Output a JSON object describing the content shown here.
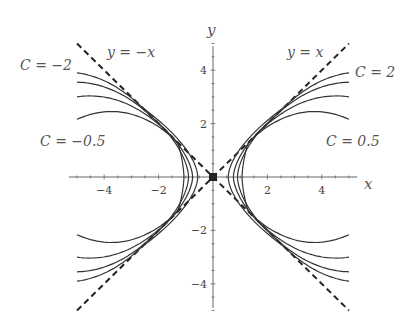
{
  "chart_data": {
    "type": "line",
    "title": "",
    "xlabel": "x",
    "ylabel": "y",
    "xlim": [
      -5.3,
      5.3
    ],
    "ylim": [
      -5.0,
      5.0
    ],
    "grid": false,
    "x_ticks": [
      -4,
      -2,
      2,
      4
    ],
    "y_ticks": [
      -4,
      -2,
      2,
      4
    ],
    "x_tick_labels": [
      "−4",
      "−2",
      "2",
      "4"
    ],
    "y_tick_labels": [
      "−4",
      "−2",
      "2",
      "4"
    ],
    "asymptotes": [
      {
        "name": "y = x",
        "label": "y = x",
        "style": "dashed",
        "from": [
          -5,
          -5
        ],
        "to": [
          5,
          5
        ]
      },
      {
        "name": "y = −x",
        "label": "y = −x",
        "style": "dashed",
        "from": [
          -5,
          5
        ],
        "to": [
          5,
          -5
        ]
      }
    ],
    "series": [
      {
        "name": "C = 0.5",
        "vertex_x": 1.07,
        "tangent_point": 1.3,
        "y_at_x5": 2.16
      },
      {
        "name": "C = 1",
        "vertex_x": 0.9,
        "tangent_point": 1.7,
        "y_at_x5": 3.0
      },
      {
        "name": "C = 1.5",
        "vertex_x": 0.75,
        "tangent_point": 2.2,
        "y_at_x5": 3.55
      },
      {
        "name": "C = 2",
        "vertex_x": 0.56,
        "tangent_point": 2.6,
        "y_at_x5": 3.9
      },
      {
        "name": "C = -0.5",
        "vertex_x": -1.07,
        "tangent_point": -1.3,
        "y_at_x5": 2.16
      },
      {
        "name": "C = -1",
        "vertex_x": -0.9,
        "tangent_point": -1.7,
        "y_at_x5": 3.0
      },
      {
        "name": "C = -1.5",
        "vertex_x": -0.75,
        "tangent_point": -2.2,
        "y_at_x5": 3.55
      },
      {
        "name": "C = -2",
        "vertex_x": -0.56,
        "tangent_point": -2.6,
        "y_at_x5": 3.9
      }
    ],
    "annotations": [
      {
        "text": "y = −x",
        "x": -3.9,
        "y": 4.6
      },
      {
        "text": "y = x",
        "x": 2.9,
        "y": 4.6
      },
      {
        "text": "C = −2",
        "x": -7.2,
        "y": 4.2
      },
      {
        "text": "C = 2",
        "x": 5.3,
        "y": 3.9
      },
      {
        "text": "C = −0.5",
        "x": -6.4,
        "y": 1.4
      },
      {
        "text": "C = 0.5",
        "x": 4.2,
        "y": 1.4
      }
    ],
    "legend": "none; curves labeled inline"
  },
  "labels": {
    "x_axis": "x",
    "y_axis": "y",
    "line_pos": "y = x",
    "line_neg": "y = −x",
    "c_pos_max": "C = 2",
    "c_pos_min": "C = 0.5",
    "c_neg_max": "C = −2",
    "c_neg_min": "C = −0.5"
  }
}
